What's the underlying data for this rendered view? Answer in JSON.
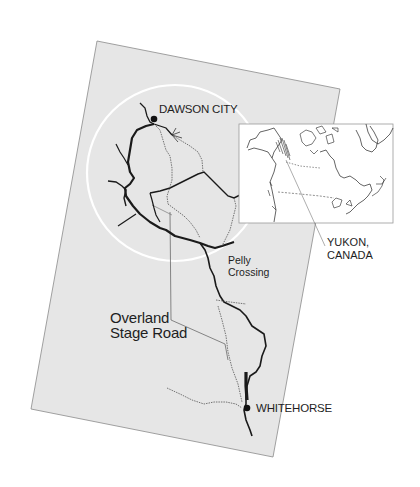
{
  "map": {
    "title": "Yukon route map",
    "colors": {
      "background": "#ffffff",
      "map_fill": "#e6e6e6",
      "map_border": "#8a8a8a",
      "river": "#1a1a1a",
      "road": "#6a6a6a",
      "circle": "#ffffff",
      "inset_fill": "#ffffff",
      "inset_border": "#9a9a9a"
    },
    "labels": {
      "dawson_city": "DAWSON CITY",
      "pelly_line1": "Pelly",
      "pelly_line2": "Crossing",
      "road_line1": "Overland",
      "road_line2": "Stage Road",
      "whitehorse": "WHITEHORSE",
      "region_line1": "YUKON,",
      "region_line2": "CANADA"
    },
    "places": [
      {
        "name": "DAWSON CITY",
        "marker": "dot"
      },
      {
        "name": "Pelly Crossing",
        "marker": "none"
      },
      {
        "name": "WHITEHORSE",
        "marker": "dot"
      }
    ],
    "inset": {
      "subject": "Canada outline map",
      "highlight": "Yukon (hatched)"
    }
  }
}
